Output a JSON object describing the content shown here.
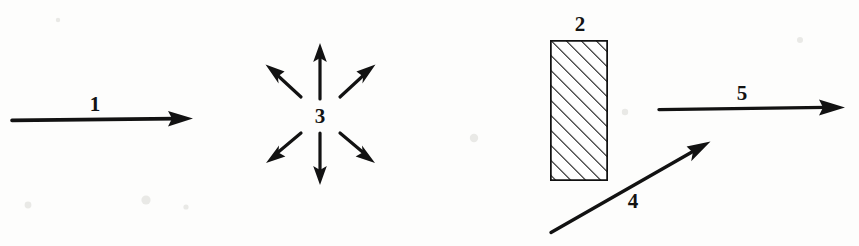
{
  "figure": {
    "title": "",
    "background_color": "#fdfdfc",
    "ink_color": "#121212",
    "width": 859,
    "height": 246,
    "labels": {
      "one": "1",
      "two": "2",
      "three": "3",
      "four": "4",
      "five": "5"
    },
    "elements": [
      {
        "id": "arrow-1",
        "kind": "arrow",
        "label": "1",
        "direction": "right",
        "from": [
          12,
          119
        ],
        "to": [
          193,
          119
        ],
        "label_pos": [
          95,
          106
        ]
      },
      {
        "id": "burst-3",
        "kind": "radial-burst",
        "label": "3",
        "center": [
          320,
          116
        ],
        "arrow_count": 6,
        "label_pos": [
          320,
          118
        ],
        "rays": [
          {
            "name": "up",
            "from": [
              320,
              98
            ],
            "to": [
              320,
              44
            ]
          },
          {
            "name": "down",
            "from": [
              320,
              134
            ],
            "to": [
              320,
              184
            ]
          },
          {
            "name": "upper-right",
            "from": [
              340,
              97
            ],
            "to": [
              374,
              66
            ]
          },
          {
            "name": "upper-left",
            "from": [
              301,
              97
            ],
            "to": [
              266,
              66
            ]
          },
          {
            "name": "lower-right",
            "from": [
              340,
              134
            ],
            "to": [
              374,
              162
            ]
          },
          {
            "name": "lower-left",
            "from": [
              301,
              134
            ],
            "to": [
              267,
              162
            ]
          }
        ]
      },
      {
        "id": "box-2",
        "kind": "hatched-rectangle",
        "label": "2",
        "x": 550,
        "y": 40,
        "width": 58,
        "height": 141,
        "hatch_angle_deg": 45,
        "hatch_spacing": 7.5,
        "label_pos": [
          580,
          26
        ]
      },
      {
        "id": "arrow-4",
        "kind": "arrow",
        "label": "4",
        "direction": "up-right",
        "from": [
          551,
          232
        ],
        "to": [
          709,
          142
        ],
        "label_pos": [
          633,
          203
        ]
      },
      {
        "id": "arrow-5",
        "kind": "arrow",
        "label": "5",
        "direction": "right",
        "from": [
          659,
          108
        ],
        "to": [
          845,
          108
        ],
        "label_pos": [
          742,
          95
        ]
      }
    ]
  }
}
